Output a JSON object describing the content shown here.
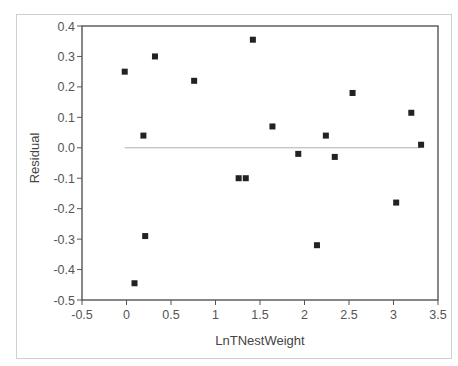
{
  "chart_data": {
    "type": "scatter",
    "title": "",
    "xlabel": "LnTNestWeight",
    "ylabel": "Residual",
    "xlim": [
      -0.5,
      3.5
    ],
    "ylim": [
      -0.5,
      0.4
    ],
    "x_ticks": [
      "-0.5",
      "0",
      "0.5",
      "1",
      "1.5",
      "2",
      "2.5",
      "3",
      "3.5"
    ],
    "y_ticks": [
      "0.4",
      "0.3",
      "0.2",
      "0.1",
      "0.0",
      "-0.1",
      "-0.2",
      "-0.3",
      "-0.4",
      "-0.5"
    ],
    "grid": false,
    "legend": null,
    "reference_line": {
      "y": 0.0,
      "x_from": -0.02,
      "x_to": 3.3,
      "color": "#b0b0b0"
    },
    "marker": {
      "shape": "square",
      "color": "#222222"
    },
    "points": [
      {
        "x": -0.02,
        "y": 0.25
      },
      {
        "x": 0.32,
        "y": 0.3
      },
      {
        "x": 0.76,
        "y": 0.22
      },
      {
        "x": 0.19,
        "y": 0.04
      },
      {
        "x": 1.42,
        "y": 0.355
      },
      {
        "x": 2.54,
        "y": 0.18
      },
      {
        "x": 3.2,
        "y": 0.115
      },
      {
        "x": 1.64,
        "y": 0.07
      },
      {
        "x": 2.24,
        "y": 0.04
      },
      {
        "x": 3.31,
        "y": 0.01
      },
      {
        "x": 1.93,
        "y": -0.02
      },
      {
        "x": 2.34,
        "y": -0.03
      },
      {
        "x": 1.26,
        "y": -0.1
      },
      {
        "x": 1.34,
        "y": -0.1
      },
      {
        "x": 0.21,
        "y": -0.29
      },
      {
        "x": 0.09,
        "y": -0.445
      },
      {
        "x": 3.03,
        "y": -0.18
      },
      {
        "x": 2.14,
        "y": -0.32
      }
    ]
  }
}
